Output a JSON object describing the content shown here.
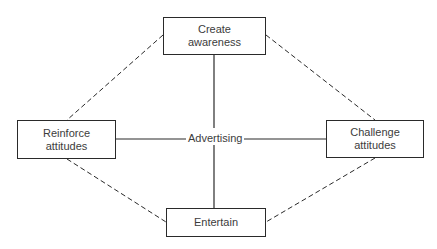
{
  "diagram": {
    "center": {
      "label": "Advertising"
    },
    "nodes": {
      "top": {
        "line1": "Create",
        "line2": "awareness"
      },
      "left": {
        "line1": "Reinforce",
        "line2": "attitudes"
      },
      "right": {
        "line1": "Challenge",
        "line2": "attitudes"
      },
      "bottom": {
        "line1": "Entertain"
      }
    },
    "edges": {
      "solid": [
        "Advertising-Create awareness",
        "Advertising-Reinforce attitudes",
        "Advertising-Challenge attitudes",
        "Advertising-Entertain"
      ],
      "dashed": [
        "Create awareness-Reinforce attitudes",
        "Create awareness-Challenge attitudes",
        "Reinforce attitudes-Entertain",
        "Challenge attitudes-Entertain"
      ]
    },
    "colors": {
      "line": "#2a2a2a",
      "text": "#3c3c3c",
      "background": "#ffffff"
    }
  }
}
